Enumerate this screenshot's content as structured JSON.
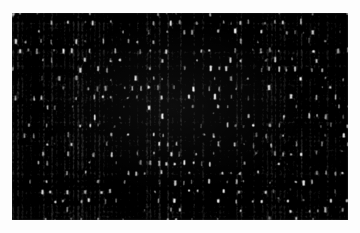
{
  "image": {
    "subject": "woven textile weave",
    "kind": "grayscale photograph",
    "caption": "",
    "colors": {
      "paper_margin": "#fdfdfd",
      "ground_dark": "#0a0a0a",
      "ground_mid": "#4a4a4a",
      "slub_light": "#f2f2f2",
      "slub_highlight": "#ffffff"
    },
    "frame": {
      "left": 12,
      "top": 13,
      "width": 336,
      "height": 207
    },
    "texture": {
      "pattern": "staggered grid of bright vertical slubs on dark ground",
      "pitch_x": 8.6,
      "pitch_y": 9.4,
      "slub_width": 4.2,
      "slub_height": 6.4,
      "row_stagger": 0.5,
      "jitter": 2.1,
      "warp_line_spacing": 4.3,
      "weft_line_spacing": 4.7,
      "grain_amount": 0.34,
      "blur_radius": 0.9,
      "bright_fraction": 0.33,
      "seed": 20240517
    }
  }
}
